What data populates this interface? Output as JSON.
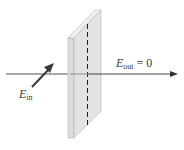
{
  "diagram": {
    "type": "polarizer-blocking-light",
    "labels": {
      "e_in": {
        "symbol": "E",
        "subscript": "in"
      },
      "e_out": {
        "symbol": "E",
        "subscript": "out",
        "rest": " = 0"
      }
    },
    "colors": {
      "axis": "#555555",
      "arrow": "#3a3a3a",
      "polarizer_front": "#d9d9d9",
      "polarizer_side": "#ececec",
      "polarizer_edge": "#b5b5b5",
      "transmission_axis": "#222222"
    }
  }
}
